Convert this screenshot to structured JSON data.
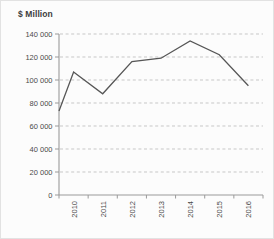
{
  "chart_data": {
    "type": "line",
    "title": "$ Million",
    "categories": [
      "2010",
      "2011",
      "2012",
      "2013",
      "2014",
      "2015",
      "2016"
    ],
    "values": [
      107000,
      88000,
      116000,
      119000,
      134000,
      122000,
      95000
    ],
    "xlabel": "",
    "ylabel": "$ Million",
    "ylim": [
      0,
      140000
    ],
    "ytick_step": 20000,
    "ytick_labels": [
      "0",
      "20 000",
      "40 000",
      "60 000",
      "80 000",
      "100 000",
      "120 000",
      "140 000"
    ],
    "grid": "horizontal-dashed",
    "legend": "none",
    "x_tick_label_rotation": -90,
    "line_starts_at_y_axis": true,
    "y_axis_intercept_value": 73000,
    "colors": {
      "series_line": "#565656",
      "axis": "#9a9a9a",
      "gridline": "#c7c7c7",
      "tick_label": "#4a4a4a",
      "title_text": "#3d3d3d",
      "background": "#fcfcfc"
    }
  }
}
